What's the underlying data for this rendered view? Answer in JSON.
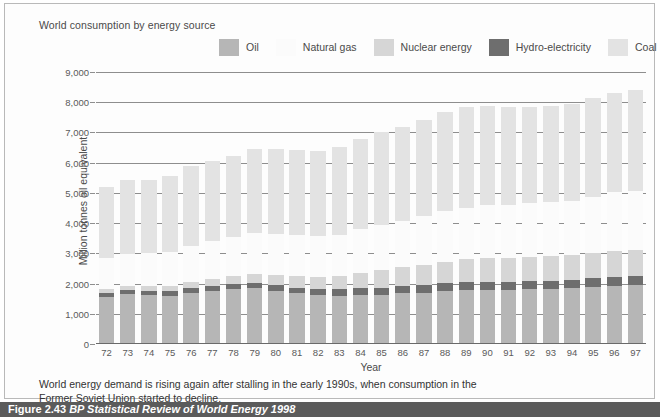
{
  "chart_title": "World consumption by energy source",
  "legend": {
    "items": [
      {
        "label": "Oil",
        "color": "#b6b6b6"
      },
      {
        "label": "Natural gas",
        "color": "#fbfbfb"
      },
      {
        "label": "Nuclear energy",
        "color": "#d6d6d6"
      },
      {
        "label": "Hydro-electricity",
        "color": "#6e6e6e"
      },
      {
        "label": "Coal",
        "color": "#e3e3e3"
      }
    ]
  },
  "caption": {
    "line1": "World energy demand is rising again after stalling in the early 1990s, when consumption in the",
    "line2": "Former Soviet Union started to decline."
  },
  "figure_credit": {
    "number": "Figure 2.43",
    "source": "BP Statistical Review of World Energy 1998"
  },
  "chart_data": {
    "type": "bar",
    "stacked": true,
    "title": "World consumption by energy source",
    "xlabel": "Year",
    "ylabel": "Million tonnes oil equivalent",
    "ylim": [
      0,
      9000
    ],
    "ytick_labels": [
      "9,000",
      "8,000",
      "7,000",
      "6,000",
      "5,000",
      "4,000",
      "3,000",
      "2,000",
      "1,000",
      "0"
    ],
    "yticks": [
      9000,
      8000,
      7000,
      6000,
      5000,
      4000,
      3000,
      2000,
      1000,
      0
    ],
    "grid": true,
    "legend_position": "top",
    "categories": [
      "72",
      "73",
      "74",
      "75",
      "76",
      "77",
      "78",
      "79",
      "80",
      "81",
      "82",
      "83",
      "84",
      "85",
      "86",
      "87",
      "88",
      "89",
      "90",
      "91",
      "92",
      "93",
      "94",
      "95",
      "96",
      "97"
    ],
    "series": [
      {
        "name": "Oil",
        "color": "#b6b6b6",
        "values": [
          1560,
          1640,
          1620,
          1600,
          1700,
          1760,
          1820,
          1850,
          1760,
          1680,
          1620,
          1600,
          1620,
          1620,
          1680,
          1700,
          1760,
          1790,
          1800,
          1800,
          1820,
          1820,
          1860,
          1890,
          1930,
          1960
        ]
      },
      {
        "name": "Hydro-electricity",
        "color": "#6e6e6e",
        "values": [
          130,
          135,
          145,
          150,
          155,
          160,
          170,
          180,
          185,
          190,
          200,
          210,
          225,
          235,
          240,
          245,
          250,
          255,
          260,
          260,
          265,
          270,
          275,
          280,
          285,
          290
        ]
      },
      {
        "name": "Nuclear energy",
        "color": "#d6d6d6",
        "values": [
          115,
          130,
          150,
          185,
          210,
          245,
          270,
          290,
          330,
          370,
          400,
          445,
          520,
          580,
          630,
          680,
          720,
          760,
          780,
          790,
          800,
          810,
          820,
          840,
          850,
          860
        ]
      },
      {
        "name": "Natural gas",
        "color": "#fbfbfb",
        "values": [
          1030,
          1090,
          1110,
          1120,
          1190,
          1230,
          1270,
          1340,
          1360,
          1360,
          1340,
          1360,
          1450,
          1490,
          1520,
          1600,
          1660,
          1700,
          1760,
          1760,
          1780,
          1800,
          1790,
          1860,
          1950,
          1950
        ]
      },
      {
        "name": "Coal",
        "color": "#e3e3e3",
        "values": [
          2370,
          2420,
          2410,
          2520,
          2620,
          2670,
          2680,
          2790,
          2820,
          2820,
          2820,
          2890,
          2970,
          3080,
          3100,
          3180,
          3280,
          3340,
          3290,
          3230,
          3180,
          3170,
          3200,
          3260,
          3290,
          3360
        ]
      }
    ],
    "totals": [
      5205,
      5415,
      5435,
      5575,
      5875,
      6065,
      6210,
      6450,
      6455,
      6420,
      6380,
      6505,
      6785,
      7005,
      7170,
      7405,
      7670,
      7845,
      7890,
      7840,
      7845,
      7870,
      7945,
      8130,
      8305,
      8420
    ],
    "annotations": []
  }
}
